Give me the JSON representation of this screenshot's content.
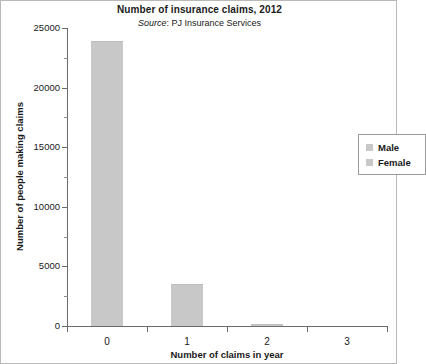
{
  "chart_data": {
    "type": "bar",
    "title": "Number of insurance claims, 2012",
    "subtitle_prefix": "Source",
    "subtitle_rest": ": PJ Insurance Services",
    "subtitle_full": "Source: PJ Insurance Services",
    "xlabel": "Number of claims in year",
    "ylabel": "Number of people making claims",
    "categories": [
      "0",
      "1",
      "2",
      "3"
    ],
    "series": [
      {
        "name": "Male",
        "color": "#c8c8c8",
        "values": [
          23900,
          3550,
          150,
          0
        ]
      },
      {
        "name": "Female",
        "color": "#c8c8c8",
        "values": [
          23900,
          3550,
          150,
          0
        ]
      }
    ],
    "ylim": [
      0,
      25000
    ],
    "ytick_labels": [
      "0",
      "5000",
      "10000",
      "15000",
      "20000",
      "25000"
    ],
    "ytick_values": [
      0,
      5000,
      10000,
      15000,
      20000,
      25000
    ],
    "yminor_values": [
      2500,
      7500,
      12500,
      17500,
      22500
    ],
    "grid": false,
    "legend_position": "upper-right",
    "legend_entries": [
      {
        "label": "Male",
        "color": "#c8c8c8"
      },
      {
        "label": "Female",
        "color": "#c8c8c8"
      }
    ],
    "bar_color": "#c8c8c8",
    "axis_color": "#6b6b6b"
  }
}
